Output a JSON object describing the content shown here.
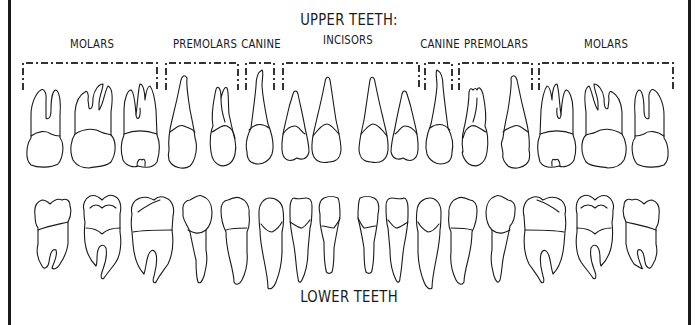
{
  "upper": {
    "title": "UPPER TEETH:",
    "groups": [
      {
        "label": "MOLARS",
        "x": 92,
        "bracket": [
          23,
          184
        ]
      },
      {
        "label": "PREMOLARS",
        "x": 205,
        "bracket": [
          166,
          238
        ]
      },
      {
        "label": "CANINE",
        "x": 261,
        "bracket": [
          246,
          274
        ]
      },
      {
        "label": "INCISORS",
        "x": 348,
        "bracket": [
          283,
          419
        ]
      },
      {
        "label": "CANINE",
        "x": 440,
        "bracket": [
          425,
          452
        ]
      },
      {
        "label": "PREMOLARS",
        "x": 496,
        "bracket": [
          459,
          532
        ]
      },
      {
        "label": "MOLARS",
        "x": 606,
        "bracket": [
          539,
          673
        ]
      }
    ]
  },
  "lower": {
    "title": "LOWER TEETH"
  },
  "colors": {
    "line": "#1a1a1a",
    "background": "#ffffff"
  }
}
